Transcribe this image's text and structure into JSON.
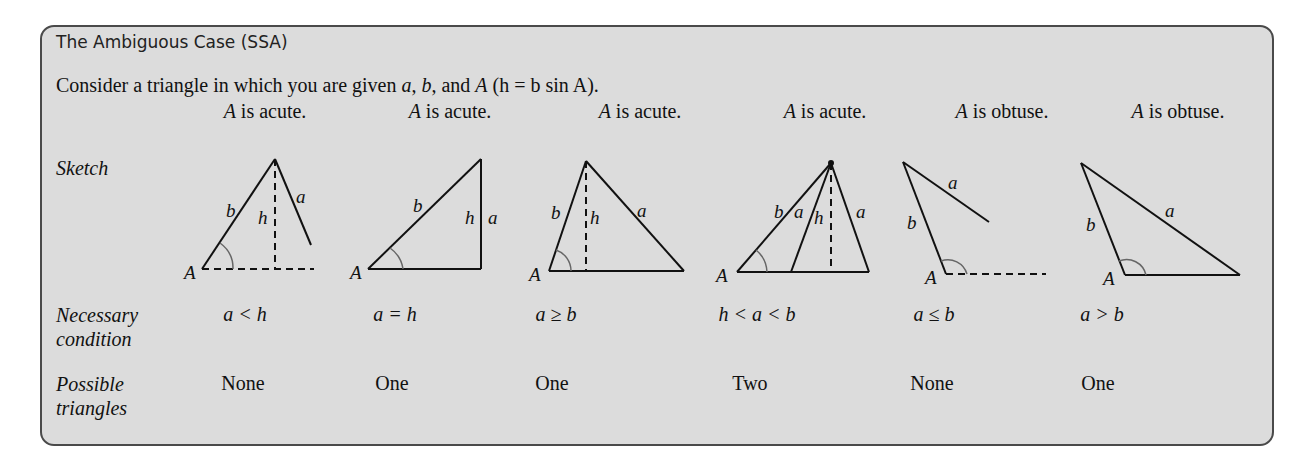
{
  "box": {
    "title": "The Ambiguous Case (SSA)",
    "intro": {
      "prefix": "Consider a triangle in which you are given ",
      "var_a": "a",
      "sep1": ", ",
      "var_b": "b",
      "sep2": ", and ",
      "var_A": "A",
      "paren": " (h = b sin A)."
    },
    "row_labels": {
      "sketch": "Sketch",
      "necessary_1": "Necessary",
      "necessary_2": "condition",
      "possible_1": "Possible",
      "possible_2": "triangles"
    },
    "columns": [
      {
        "angle_var": "A",
        "angle_text": " is acute.",
        "condition": "a < h",
        "triangles": "None"
      },
      {
        "angle_var": "A",
        "angle_text": " is acute.",
        "condition": "a = h",
        "triangles": "One"
      },
      {
        "angle_var": "A",
        "angle_text": " is acute.",
        "condition": "a ≥ b",
        "triangles": "One"
      },
      {
        "angle_var": "A",
        "angle_text": " is acute.",
        "condition": "h < a < b",
        "triangles": "Two"
      },
      {
        "angle_var": "A",
        "angle_text": " is obtuse.",
        "condition": "a ≤ b",
        "triangles": "None"
      },
      {
        "angle_var": "A",
        "angle_text": " is obtuse.",
        "condition": "a > b",
        "triangles": "One"
      }
    ],
    "sketch_labels": {
      "A": "A",
      "a": "a",
      "b": "b",
      "h": "h"
    }
  }
}
